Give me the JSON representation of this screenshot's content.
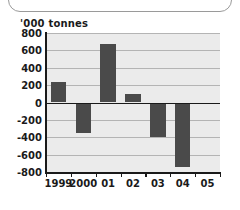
{
  "chart_data": {
    "type": "bar",
    "title": "",
    "ylabel": "'000 tonnes",
    "xlabel": "",
    "categories": [
      "1999",
      "2000",
      "01",
      "02",
      "03",
      "04",
      "05"
    ],
    "values": [
      240,
      -355,
      675,
      100,
      -395,
      -740,
      0
    ],
    "ylim": [
      -800,
      800
    ],
    "ytick_labels": [
      "800",
      "600",
      "400",
      "200",
      "0",
      "-200",
      "-400",
      "-600",
      "-800"
    ],
    "ytick_values": [
      800,
      600,
      400,
      200,
      0,
      -200,
      -400,
      -600,
      -800
    ],
    "grid": true,
    "legend": false,
    "bar_color": "#4a4a4a",
    "plot_background": "#ebebeb",
    "axis_color": "#1a1a1a",
    "gridline_color": "#b4b4b4"
  }
}
